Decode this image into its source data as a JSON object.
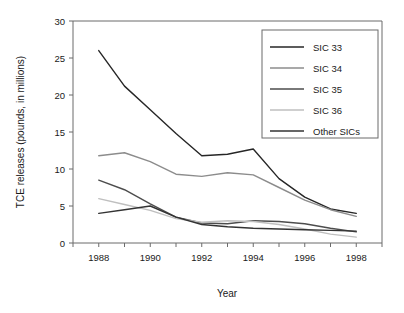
{
  "chart_data": {
    "type": "line",
    "title": "",
    "xlabel": "Year",
    "ylabel": "TCE releases (pounds, in millions)",
    "xlim": [
      1987,
      1999
    ],
    "ylim": [
      0,
      30
    ],
    "grid": false,
    "legend_position": "top-right",
    "x": [
      1988,
      1989,
      1990,
      1991,
      1992,
      1993,
      1994,
      1995,
      1996,
      1997,
      1998
    ],
    "x_tick_labels": [
      "1988",
      "1990",
      "1992",
      "1994",
      "1996",
      "1998"
    ],
    "x_tick_values": [
      1988,
      1990,
      1992,
      1994,
      1996,
      1998
    ],
    "y_tick_labels": [
      "0",
      "5",
      "10",
      "15",
      "20",
      "25",
      "30"
    ],
    "y_tick_values": [
      0,
      5,
      10,
      15,
      20,
      25,
      30
    ],
    "series": [
      {
        "name": "SIC 33",
        "color": "#262626",
        "values": [
          26.0,
          21.2,
          18.0,
          14.8,
          11.8,
          12.0,
          12.7,
          8.7,
          6.2,
          4.6,
          4.0
        ]
      },
      {
        "name": "SIC 34",
        "color": "#8c8c8c",
        "values": [
          11.8,
          12.2,
          11.0,
          9.3,
          9.0,
          9.5,
          9.2,
          7.5,
          5.8,
          4.5,
          3.6
        ]
      },
      {
        "name": "SIC 35",
        "color": "#4d4d4d",
        "values": [
          8.5,
          7.2,
          5.3,
          3.5,
          2.7,
          2.6,
          3.0,
          2.9,
          2.6,
          2.0,
          1.5
        ]
      },
      {
        "name": "SIC 36",
        "color": "#bfbfbf",
        "values": [
          6.0,
          5.2,
          4.4,
          3.3,
          2.8,
          3.0,
          2.9,
          2.5,
          1.9,
          1.2,
          0.8
        ]
      },
      {
        "name": "Other SICs",
        "color": "#333333",
        "values": [
          4.0,
          4.5,
          5.0,
          3.5,
          2.5,
          2.2,
          2.0,
          1.9,
          1.8,
          1.7,
          1.6
        ]
      }
    ]
  },
  "axes": {
    "x_title": "Year",
    "y_title": "TCE releases (pounds, in millions)"
  },
  "legend": {
    "entries": [
      {
        "label": "SIC 33"
      },
      {
        "label": "SIC 34"
      },
      {
        "label": "SIC 35"
      },
      {
        "label": "SIC 36"
      },
      {
        "label": "Other SICs"
      }
    ]
  }
}
